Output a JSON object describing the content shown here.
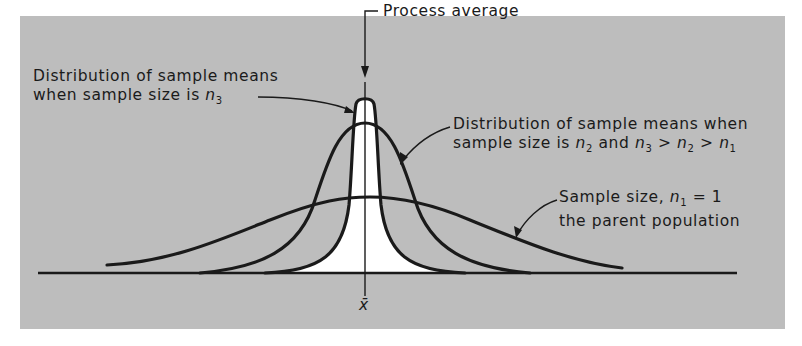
{
  "figure": {
    "background_color": "#bdbdbd",
    "line_color": "#1a1a1a",
    "fill_color": "#ffffff",
    "labels": {
      "process_average": "Process average",
      "n3": {
        "line1": "Distribution of sample means",
        "line2_prefix": "when sample size is ",
        "var": "n",
        "sub": "3"
      },
      "n2": {
        "line1": "Distribution of sample means when",
        "line2_prefix": "sample size is ",
        "var": "n",
        "sub": "2",
        "and": " and ",
        "ineq_sub3": "3",
        "gt": " > ",
        "ineq_sub2": "2",
        "ineq_sub1": "1"
      },
      "n1": {
        "line1_prefix": "Sample size, ",
        "var": "n",
        "sub": "1",
        "eq": " = 1",
        "line2": "the parent population"
      },
      "x_axis_mark": "x̄"
    },
    "curves": [
      {
        "name": "n1 parent population",
        "relative_width": "wide",
        "peak_height": "low"
      },
      {
        "name": "n2 sample means",
        "relative_width": "medium",
        "peak_height": "medium"
      },
      {
        "name": "n3 sample means",
        "relative_width": "narrow",
        "peak_height": "high"
      }
    ]
  }
}
